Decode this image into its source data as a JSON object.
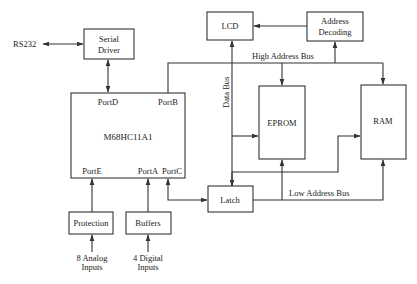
{
  "diagram": {
    "external": {
      "rs232": "RS232",
      "analog_inputs": [
        "8 Analog",
        "Inputs"
      ],
      "digital_inputs": [
        "4 Digital",
        "Inputs"
      ]
    },
    "blocks": {
      "serial_driver": [
        "Serial",
        "Driver"
      ],
      "mcu": "M68HC11A1",
      "lcd": "LCD",
      "address_decoding": [
        "Address",
        "Decoding"
      ],
      "eprom": "EPROM",
      "ram": "RAM",
      "latch": "Latch",
      "protection": "Protection",
      "buffers": "Buffers"
    },
    "ports": {
      "portD": "PortD",
      "portB": "PortB",
      "portE": "PortE",
      "portA": "PortA",
      "portC": "PortC"
    },
    "buses": {
      "high_address": "High Address Bus",
      "low_address": "Low Address Bus",
      "data": "Data Bus"
    },
    "colors": {
      "stroke": "#333333",
      "background": "#ffffff",
      "text": "#222222"
    }
  }
}
